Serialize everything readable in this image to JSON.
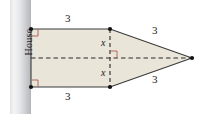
{
  "figure": {
    "house_label": "House",
    "labels": {
      "top_side": "3",
      "bottom_side": "3",
      "upper_slant": "3",
      "lower_slant": "3",
      "upper_half_height": "x",
      "lower_half_height": "x"
    },
    "colors": {
      "fill": "#e9e5d9",
      "outline": "#3b3b3b",
      "right_angle_marker": "#b4675c",
      "dashed_line": "#2b2b2b",
      "wall_light": "#f2f2f3",
      "wall_dark": "#b9babc",
      "vertex_dot": "#111111",
      "background": "#ffffff"
    },
    "geometry": {
      "rect_left_x": 31,
      "rect_right_x": 110,
      "rect_top_y": 29,
      "rect_bottom_y": 87,
      "apex_x": 192,
      "apex_y": 58,
      "wall_left_x": 10,
      "wall_right_x": 31
    }
  }
}
